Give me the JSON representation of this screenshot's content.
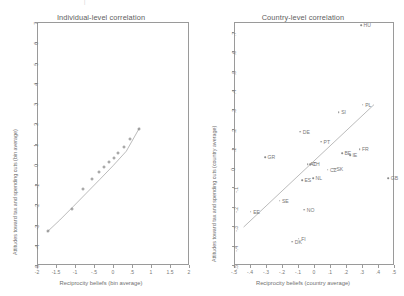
{
  "figure": {
    "background": "#ffffff",
    "ink_color": "#8d8d8d",
    "text_color": "#6f6f6f",
    "top_mark": "|"
  },
  "chart_data": [
    {
      "type": "scatter",
      "panel_id": "individual-level",
      "title": "Individual-level correlation",
      "xlabel": "Reciprocity beliefs (bin average)",
      "ylabel": "Attitudes toward tax and spending cuts (bin average)",
      "xlim": [
        -2,
        2
      ],
      "ylim": [
        -5,
        7
      ],
      "xticks": [
        "-2",
        "-1.5",
        "-1",
        "-.5",
        "0",
        ".5",
        "1",
        "1.5",
        "2"
      ],
      "xtick_values": [
        -2,
        -1.5,
        -1,
        -0.5,
        0,
        0.5,
        1,
        1.5,
        2
      ],
      "yticks": [
        "-5",
        "-4",
        "-3",
        "-2",
        "-1",
        "0",
        "1",
        "2",
        "3",
        "4",
        "5",
        "6",
        "7"
      ],
      "ytick_values": [
        -5,
        -4,
        -3,
        -2,
        -1,
        0,
        1,
        2,
        3,
        4,
        5,
        6,
        7
      ],
      "grid": false,
      "legend": "none",
      "marker": "open-circle",
      "x": [
        -1.72,
        -1.08,
        -0.78,
        -0.55,
        -0.38,
        -0.24,
        -0.11,
        0.02,
        0.14,
        0.28,
        0.45,
        0.68
      ],
      "y": [
        -3.32,
        -2.22,
        -1.26,
        -0.75,
        -0.42,
        -0.14,
        0.1,
        0.3,
        0.55,
        0.82,
        1.2,
        1.72
      ],
      "fit": {
        "kind": "smoothed-curve",
        "x": [
          -1.74,
          -1.4,
          -1.05,
          -0.7,
          -0.35,
          0,
          0.35,
          0.7
        ],
        "y": [
          -3.38,
          -2.78,
          -2.12,
          -1.45,
          -0.78,
          -0.1,
          0.62,
          1.78
        ]
      }
    },
    {
      "type": "scatter",
      "panel_id": "country-level",
      "title": "Country-level correlation",
      "xlabel": "Reciprocity beliefs (country average)",
      "ylabel": "Attitudes toward tax and spending cuts (country average)",
      "xlim": [
        -0.5,
        0.5
      ],
      "ylim": [
        -0.5,
        0.75
      ],
      "xticks": [
        "-.5",
        "-.4",
        "-.3",
        "-.2",
        "-.1",
        "0",
        ".1",
        ".2",
        ".3",
        ".4",
        ".5"
      ],
      "xtick_values": [
        -0.5,
        -0.4,
        -0.3,
        -0.2,
        -0.1,
        0,
        0.1,
        0.2,
        0.3,
        0.4,
        0.5
      ],
      "yticks": [
        "-.5",
        "-.4",
        "-.3",
        "-.2",
        "-.1",
        "0",
        ".1",
        ".2",
        ".3",
        ".4",
        ".5",
        ".6",
        ".7"
      ],
      "ytick_values": [
        -0.5,
        -0.4,
        -0.3,
        -0.2,
        -0.1,
        0,
        0.1,
        0.2,
        0.3,
        0.4,
        0.5,
        0.6,
        0.7
      ],
      "grid": false,
      "legend": "none",
      "marker": "dot-with-label",
      "points": [
        {
          "label": "HU",
          "x": 0.295,
          "y": 0.735
        },
        {
          "label": "PL",
          "x": 0.305,
          "y": 0.325
        },
        {
          "label": "SI",
          "x": 0.155,
          "y": 0.285
        },
        {
          "label": "DE",
          "x": -0.085,
          "y": 0.185
        },
        {
          "label": "PT",
          "x": 0.045,
          "y": 0.135
        },
        {
          "label": "FR",
          "x": 0.285,
          "y": 0.095
        },
        {
          "label": "BE",
          "x": 0.175,
          "y": 0.075
        },
        {
          "label": "IE",
          "x": 0.225,
          "y": 0.065
        },
        {
          "label": "AT",
          "x": -0.04,
          "y": 0.02
        },
        {
          "label": "CH",
          "x": -0.025,
          "y": 0.02
        },
        {
          "label": "GR",
          "x": -0.305,
          "y": 0.055
        },
        {
          "label": "CZ",
          "x": 0.085,
          "y": -0.01
        },
        {
          "label": "SK",
          "x": 0.125,
          "y": -0.005
        },
        {
          "label": "NL",
          "x": -0.005,
          "y": -0.055
        },
        {
          "label": "ES",
          "x": -0.075,
          "y": -0.065
        },
        {
          "label": "SE",
          "x": -0.215,
          "y": -0.17
        },
        {
          "label": "EE",
          "x": -0.395,
          "y": -0.225
        },
        {
          "label": "NO",
          "x": -0.06,
          "y": -0.215
        },
        {
          "label": "DK",
          "x": -0.135,
          "y": -0.38
        },
        {
          "label": "FI",
          "x": -0.095,
          "y": -0.365
        },
        {
          "label": "GB",
          "x": 0.465,
          "y": -0.055
        }
      ],
      "fit": {
        "kind": "linear",
        "x": [
          -0.44,
          0.375
        ],
        "y": [
          -0.305,
          0.325
        ]
      }
    }
  ]
}
